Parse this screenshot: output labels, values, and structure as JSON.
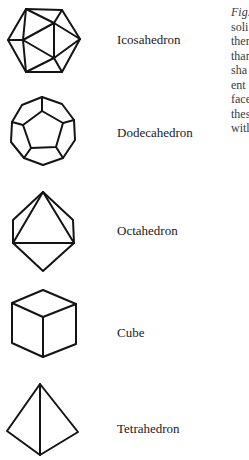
{
  "figure": {
    "solids": [
      {
        "id": "icosahedron",
        "label": "Icosahedron"
      },
      {
        "id": "dodecahedron",
        "label": "Dodecahedron"
      },
      {
        "id": "octahedron",
        "label": "Octahedron"
      },
      {
        "id": "cube",
        "label": "Cube"
      },
      {
        "id": "tetrahedron",
        "label": "Tetrahedron"
      }
    ]
  },
  "caption": {
    "fig_label": "Fig.",
    "lines": [
      "soli",
      "ther",
      "than",
      "sha",
      "ent",
      "face",
      "thes",
      "witl"
    ]
  },
  "colors": {
    "ink": "#141414",
    "caption_text": "#3a3a3a",
    "background": "#ffffff"
  }
}
